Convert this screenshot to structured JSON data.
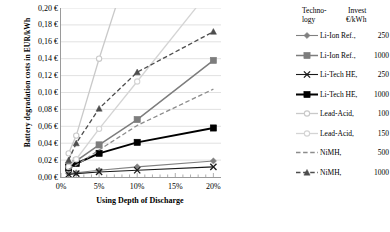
{
  "chart_data": {
    "type": "line",
    "title": "",
    "xlabel": "Using Depth of Discharge",
    "ylabel": "Battery degradation costs in EUR/kWh",
    "x": [
      1,
      2,
      5,
      10,
      20
    ],
    "x_tick_labels": [
      "0%",
      "5%",
      "10%",
      "15%",
      "20%"
    ],
    "x_tick_values": [
      0,
      5,
      10,
      15,
      20
    ],
    "xlim": [
      0,
      21
    ],
    "y_tick_labels": [
      "0,00 €",
      "0,02 €",
      "0,04 €",
      "0,06 €",
      "0,08 €",
      "0,10 €",
      "0,12 €",
      "0,14 €",
      "0,16 €",
      "0,18 €",
      "0,20 €"
    ],
    "y_tick_values": [
      0.0,
      0.02,
      0.04,
      0.06,
      0.08,
      0.1,
      0.12,
      0.14,
      0.16,
      0.18,
      0.2
    ],
    "ylim": [
      0,
      0.2
    ],
    "grid": "horizontal",
    "legend_position": "right",
    "legend_header": {
      "technology_line1": "Techno-",
      "technology_line2": "logy",
      "invest_line1": "Invest",
      "invest_line2": "€/kWh"
    },
    "series": [
      {
        "name": "Li-Ion Ref.",
        "invest": "250",
        "color": "#808080",
        "marker": "diamond",
        "dash": "solid",
        "width": 1.1,
        "values": [
          0.004,
          0.005,
          0.008,
          0.012,
          0.019
        ]
      },
      {
        "name": "Li-Ion Ref.",
        "invest": "1000",
        "color": "#7d7d7d",
        "marker": "square",
        "dash": "solid",
        "width": 1.5,
        "values": [
          0.013,
          0.019,
          0.038,
          0.068,
          0.138
        ]
      },
      {
        "name": "Li-Tech HE",
        "invest": "250",
        "color": "#1a1a1a",
        "marker": "cross",
        "dash": "solid",
        "width": 1.1,
        "values": [
          0.003,
          0.004,
          0.006,
          0.008,
          0.012
        ]
      },
      {
        "name": "Li-Tech HE",
        "invest": "1000",
        "color": "#000000",
        "marker": "square",
        "dash": "solid",
        "width": 2.0,
        "values": [
          0.011,
          0.016,
          0.028,
          0.041,
          0.058
        ]
      },
      {
        "name": "Lead-Acid",
        "invest": "100",
        "color": "#c9c9c9",
        "marker": "circle",
        "dash": "solid",
        "width": 1.3,
        "values": [
          0.028,
          0.049,
          0.14,
          0.28,
          0.56
        ]
      },
      {
        "name": "Lead-Acid",
        "invest": "150",
        "color": "#d4d4d4",
        "marker": "circle",
        "dash": "solid",
        "width": 1.3,
        "values": [
          0.012,
          0.021,
          0.057,
          0.113,
          0.226
        ]
      },
      {
        "name": "NiMH",
        "invest": "500",
        "color": "#8c8c8c",
        "marker": "none",
        "dash": "dash",
        "width": 1.3,
        "values": [
          0.009,
          0.014,
          0.032,
          0.061,
          0.104
        ]
      },
      {
        "name": "NiMH",
        "invest": "1000",
        "color": "#4d4d4d",
        "marker": "triangle",
        "dash": "dash",
        "width": 1.3,
        "values": [
          0.02,
          0.04,
          0.081,
          0.124,
          0.172
        ]
      }
    ]
  },
  "colors": {
    "axis": "#9a9a9a",
    "grid": "#d9d9d9",
    "text": "#000000"
  }
}
